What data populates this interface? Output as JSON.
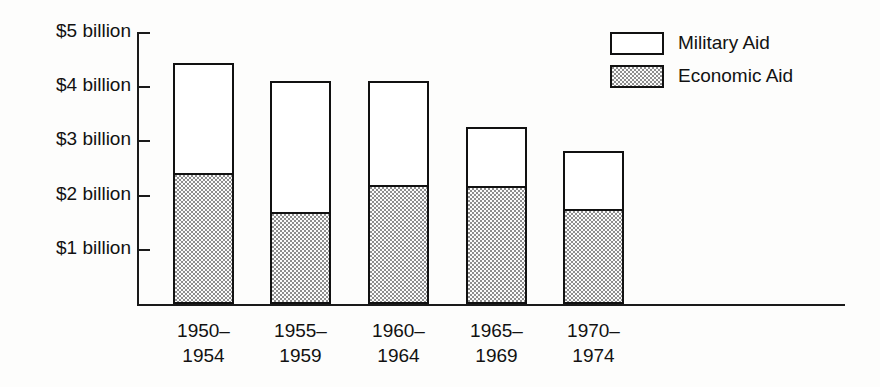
{
  "chart_data": {
    "type": "bar",
    "subtype": "stacked-vertical",
    "title": "",
    "xlabel": "",
    "ylabel": "",
    "categories": [
      "1950–\n1954",
      "1955–\n1959",
      "1960–\n1964",
      "1965–\n1969",
      "1970–\n1974"
    ],
    "categories_lines": [
      [
        "1950–",
        "1954"
      ],
      [
        "1955–",
        "1959"
      ],
      [
        "1960–",
        "1964"
      ],
      [
        "1965–",
        "1969"
      ],
      [
        "1970–",
        "1974"
      ]
    ],
    "series": [
      {
        "name": "Economic Aid",
        "values": [
          2.42,
          1.7,
          2.2,
          2.18,
          1.75
        ],
        "fill": "stipple"
      },
      {
        "name": "Military Aid",
        "values": [
          2.03,
          2.41,
          1.91,
          1.09,
          1.07
        ],
        "fill": "white"
      }
    ],
    "totals": [
      4.45,
      4.11,
      4.11,
      3.27,
      2.82
    ],
    "units": "billions of dollars",
    "ylim": [
      0,
      5
    ],
    "ytick_values": [
      5,
      4,
      3,
      2,
      1
    ],
    "ytick_labels": [
      "$5 billion",
      "$4 billion",
      "$3 billion",
      "$2 billion",
      "$1 billion"
    ],
    "grid": false,
    "legend_position": "top-right",
    "colors": {
      "outline": "#111111",
      "military_fill": "#ffffff",
      "economic_fill": "#fbfbfb",
      "economic_dots": "#8d8d8d",
      "text": "#121212",
      "background": "#fdfdfc"
    }
  },
  "legend": {
    "items": [
      {
        "label": "Military Aid",
        "swatch": "white-swatch"
      },
      {
        "label": "Economic Aid",
        "swatch": "stipple-swatch"
      }
    ]
  }
}
